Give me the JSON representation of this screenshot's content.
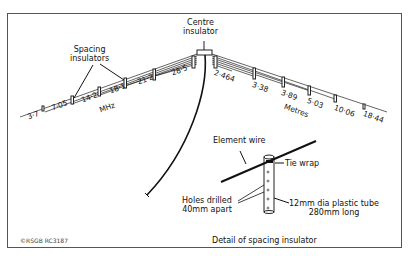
{
  "diagram": {
    "title_centre": [
      "Centre",
      "insulator"
    ],
    "spacing_label": [
      "Spacing",
      "insulators"
    ],
    "mhz_unit": "MHz",
    "metres_unit": "Metres",
    "frequencies_mhz": [
      "3·7",
      "7·05",
      "14·2",
      "18·1",
      "21·2",
      "28·5"
    ],
    "lengths_metres": [
      "2·464",
      "3·38",
      "3·89",
      "5·03",
      "10·06",
      "18·44"
    ],
    "detail": {
      "element_wire": "Element wire",
      "tie_wrap": "Tie wrap",
      "holes": [
        "Holes drilled",
        "40mm apart"
      ],
      "tube": [
        "12mm dia plastic tube",
        "280mm long"
      ],
      "caption": "Detail of spacing insulator"
    },
    "copyright": "©RSGB RC3187"
  }
}
